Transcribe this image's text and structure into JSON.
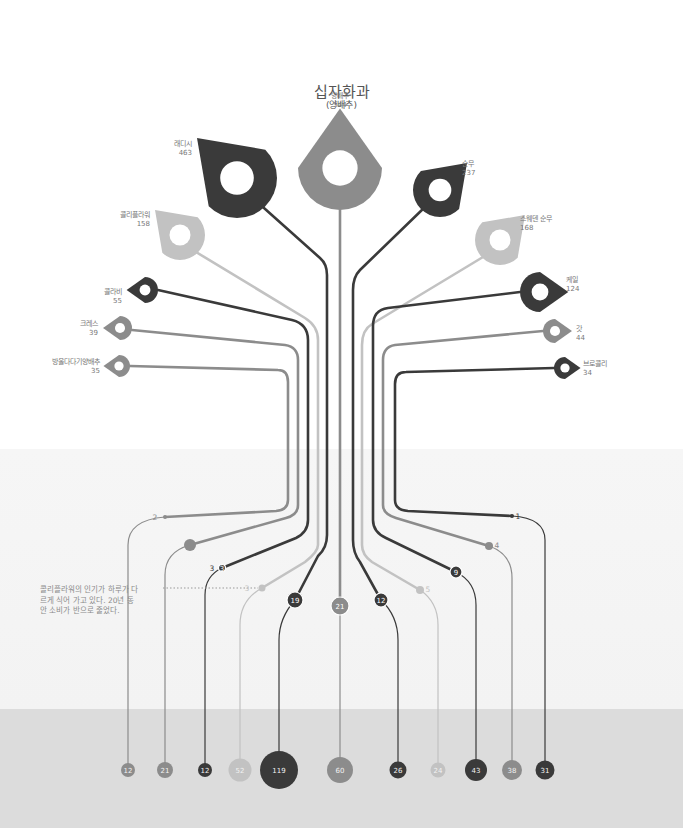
{
  "title": "십자화과",
  "subtitle": "(양배추)",
  "note": "콜리플라워의 인기가 하루가 다르게 식어 가고 있다. 20년 동안 소비가 반으로 줄었다.",
  "colors": {
    "dark": "#3a3a3a",
    "mid": "#8c8c8c",
    "light": "#c2c2c2",
    "band_mid": "#f4f4f4",
    "band_bottom": "#dcdcdc"
  },
  "vegetables": [
    {
      "id": "radish",
      "name": "래디시",
      "value": "463",
      "tone": "dark",
      "icon": "radish-icon",
      "mid_value": "19",
      "bottom_value": "119"
    },
    {
      "id": "cabbage",
      "name": "양배추",
      "value": "544",
      "tone": "mid",
      "icon": "cabbage-icon",
      "mid_value": "21",
      "bottom_value": "60"
    },
    {
      "id": "turnip",
      "name": "순무",
      "value": "237",
      "tone": "dark",
      "icon": "turnip-icon",
      "mid_value": "12",
      "bottom_value": "26"
    },
    {
      "id": "cauliflower",
      "name": "콜리플라워",
      "value": "158",
      "tone": "light",
      "icon": "cauliflower-icon",
      "mid_value": "3",
      "bottom_value": "52"
    },
    {
      "id": "swede",
      "name": "스웨덴 순무",
      "value": "168",
      "tone": "light",
      "icon": "swede-icon",
      "mid_value": "5",
      "bottom_value": "24"
    },
    {
      "id": "kohlrabi",
      "name": "콜라비",
      "value": "55",
      "tone": "dark",
      "icon": "kohlrabi-icon",
      "mid_value": "3",
      "bottom_value": "12"
    },
    {
      "id": "kale",
      "name": "케일",
      "value": "124",
      "tone": "dark",
      "icon": "kale-icon",
      "mid_value": "9",
      "bottom_value": "43"
    },
    {
      "id": "cress",
      "name": "크레스",
      "value": "39",
      "tone": "mid",
      "icon": "cress-icon",
      "mid_value": "8",
      "bottom_value": "21"
    },
    {
      "id": "mustard",
      "name": "갓",
      "value": "44",
      "tone": "mid",
      "icon": "mustard-icon",
      "mid_value": "4",
      "bottom_value": "38"
    },
    {
      "id": "brussels",
      "name": "방울다다기양배추",
      "value": "35",
      "tone": "mid",
      "icon": "brussels-sprout-icon",
      "mid_value": "2",
      "bottom_value": "12"
    },
    {
      "id": "broccoli",
      "name": "브로콜리",
      "value": "34",
      "tone": "dark",
      "icon": "broccoli-icon",
      "mid_value": "1",
      "bottom_value": "31"
    }
  ]
}
